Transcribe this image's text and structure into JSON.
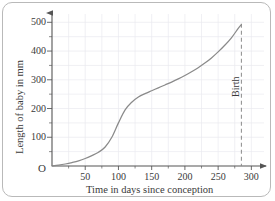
{
  "chart_data": {
    "type": "line",
    "title": "",
    "xlabel": "Time in days since conception",
    "ylabel": "Length of baby in mm",
    "xlim": [
      0,
      310
    ],
    "ylim": [
      0,
      515
    ],
    "xticks": [
      50,
      100,
      150,
      200,
      250,
      300
    ],
    "yticks": [
      100,
      200,
      300,
      400,
      500
    ],
    "x_minor_step": 25,
    "y_minor_step": 50,
    "grid": true,
    "legend": "none",
    "origin_label": "O",
    "series": [
      {
        "name": "Length of baby",
        "color": "#8a8a8a",
        "x": [
          0,
          10,
          20,
          30,
          40,
          50,
          60,
          70,
          80,
          90,
          100,
          110,
          120,
          130,
          140,
          150,
          160,
          170,
          180,
          190,
          200,
          210,
          220,
          230,
          240,
          250,
          260,
          270,
          280,
          285
        ],
        "y": [
          0,
          3,
          7,
          12,
          18,
          26,
          36,
          48,
          66,
          100,
          150,
          195,
          222,
          240,
          252,
          262,
          272,
          282,
          292,
          303,
          315,
          328,
          342,
          358,
          376,
          397,
          420,
          446,
          478,
          492
        ]
      }
    ],
    "annotations": [
      {
        "name": "birth-marker",
        "label": "Birth",
        "x": 285,
        "style": "dashed-vertical-line",
        "color": "#8a8a8a"
      }
    ]
  }
}
